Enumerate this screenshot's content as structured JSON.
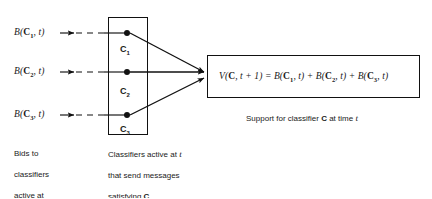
{
  "figure": {
    "type": "flow-diagram",
    "background": "#ffffff",
    "ink": "#111111"
  },
  "bids": {
    "items": [
      {
        "prefix": "B(",
        "symbol": "C",
        "index": "1",
        "suffix": ", t)"
      },
      {
        "prefix": "B(",
        "symbol": "C",
        "index": "2",
        "suffix": ", t)"
      },
      {
        "prefix": "B(",
        "symbol": "C",
        "index": "3",
        "suffix": ", t)"
      }
    ]
  },
  "classifier_box": {
    "nodes": [
      {
        "symbol": "C",
        "index": "1"
      },
      {
        "symbol": "C",
        "index": "2"
      },
      {
        "symbol": "C",
        "index": "3"
      }
    ]
  },
  "equation": {
    "lhs_fn": "V(",
    "lhs_symbol": "C",
    "lhs_args": ", t + 1)",
    "equals": " = ",
    "terms": [
      {
        "fn": "B(",
        "symbol": "C",
        "index": "1",
        "args": ", t)"
      },
      {
        "fn": "B(",
        "symbol": "C",
        "index": "2",
        "args": ", t)"
      },
      {
        "fn": "B(",
        "symbol": "C",
        "index": "3",
        "args": ", t)"
      }
    ],
    "plus": " + "
  },
  "captions": {
    "bids": "Bids to\nclassifiers\nactive at\nt − 1",
    "bids_lines": [
      "Bids to",
      "classifiers",
      "active at"
    ],
    "bids_last_pre": "t",
    "bids_last_post": " − 1",
    "classifiers_lines": [
      "Classifiers active at ",
      "that send messages",
      "satisfying "
    ],
    "classifiers_line1_pre": "Classifiers active at ",
    "classifiers_line1_it": "t",
    "classifiers_line2": "that send messages",
    "classifiers_line3_pre": "satisfying ",
    "classifiers_line3_bold": "C",
    "support_pre": "Support for classifier ",
    "support_bold": "C",
    "support_mid": " at time ",
    "support_it": "t"
  }
}
